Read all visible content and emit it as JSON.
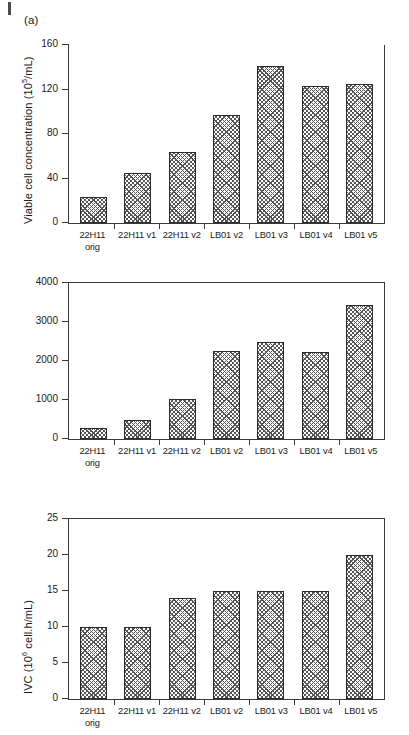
{
  "figure": {
    "panel_a_label": "(a)",
    "categories": [
      "22H11 orig",
      "22H11 v1",
      "22H11 v2",
      "LB01 v2",
      "LB01 v3",
      "LB01 v4",
      "LB01 v5"
    ],
    "category_lines": [
      {
        "line1": "22H11",
        "line2": "orig"
      },
      {
        "line1": "22H11 v1",
        "line2": ""
      },
      {
        "line1": "22H11 v2",
        "line2": ""
      },
      {
        "line1": "LB01 v2",
        "line2": ""
      },
      {
        "line1": "LB01 v3",
        "line2": ""
      },
      {
        "line1": "LB01 v4",
        "line2": ""
      },
      {
        "line1": "LB01 v5",
        "line2": ""
      }
    ],
    "bar_fill_color": "#ffffff",
    "bar_hatch_color": "#555555",
    "bar_edge_color": "#2b2b2b",
    "axis_color": "#3a3a3a"
  },
  "chart_data": [
    {
      "type": "bar",
      "panel": "(a)",
      "title": "",
      "xlabel": "",
      "ylabel": "Viable cell concentration (10^5/mL)",
      "ylabel_prefix": "Viable cell concentration (10",
      "ylabel_exponent": "5",
      "ylabel_suffix": "/mL)",
      "categories": [
        "22H11 orig",
        "22H11 v1",
        "22H11 v2",
        "LB01 v2",
        "LB01 v3",
        "LB01 v4",
        "LB01 v5"
      ],
      "values": [
        23,
        45,
        64,
        97,
        141,
        123,
        125
      ],
      "ylim": [
        0,
        160
      ],
      "yticks": [
        0,
        40,
        80,
        120,
        160
      ],
      "ytick_labels": [
        "0",
        "40",
        "80",
        "120",
        "160"
      ],
      "grid": false,
      "legend": false
    },
    {
      "type": "bar",
      "panel": "(b)",
      "title": "",
      "xlabel": "",
      "ylabel": "IVC (10^6 cell.h/mL)",
      "ylabel_prefix": "IVC (10",
      "ylabel_exponent": "6",
      "ylabel_suffix": " cell.h/mL)",
      "categories": [
        "22H11 orig",
        "22H11 v1",
        "22H11 v2",
        "LB01 v2",
        "LB01 v3",
        "LB01 v4",
        "LB01 v5"
      ],
      "values": [
        270,
        490,
        1030,
        2250,
        2480,
        2230,
        3440
      ],
      "ylim": [
        0,
        4000
      ],
      "yticks": [
        0,
        1000,
        2000,
        3000,
        4000
      ],
      "ytick_labels": [
        "0",
        "1000",
        "2000",
        "3000",
        "4000"
      ],
      "grid": false,
      "legend": false
    },
    {
      "type": "bar",
      "panel": "(c)",
      "title": "",
      "xlabel": "",
      "ylabel": "Process duration (days)",
      "ylabel_prefix": "Process duration (days)",
      "ylabel_exponent": "",
      "ylabel_suffix": "",
      "categories": [
        "22H11 orig",
        "22H11 v1",
        "22H11 v2",
        "LB01 v2",
        "LB01 v3",
        "LB01 v4",
        "LB01 v5"
      ],
      "values": [
        10,
        10,
        14,
        15,
        15,
        15,
        20
      ],
      "ylim": [
        0,
        25
      ],
      "yticks": [
        0,
        5,
        10,
        15,
        20,
        25
      ],
      "ytick_labels": [
        "0",
        "5",
        "10",
        "15",
        "20",
        "25"
      ],
      "grid": false,
      "legend": false
    }
  ]
}
